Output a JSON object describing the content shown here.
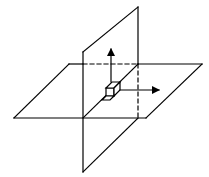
{
  "diagram": {
    "title": "",
    "colors": {
      "stroke": "#000000",
      "background": "#ffffff"
    },
    "horizontal_plane": {
      "points": [
        [
          69,
          64
        ],
        [
          202,
          64
        ],
        [
          146,
          118
        ],
        [
          14,
          118
        ]
      ]
    },
    "vertical_plane": {
      "points": [
        [
          83,
          52
        ],
        [
          138,
          7
        ],
        [
          138,
          118
        ],
        [
          83,
          172
        ]
      ]
    },
    "intersection_line": [
      [
        138,
        64
      ],
      [
        83,
        118
      ]
    ],
    "hidden_edges": [
      [
        [
          83,
          64
        ],
        [
          138,
          64
        ]
      ],
      [
        [
          138,
          64
        ],
        [
          138,
          118
        ]
      ]
    ],
    "arrows": [
      {
        "name": "up-arrow",
        "from": [
          111,
          90
        ],
        "to": [
          111,
          48
        ]
      },
      {
        "name": "right-arrow",
        "from": [
          116,
          90
        ],
        "to": [
          158,
          90
        ]
      }
    ],
    "element_box": {
      "center": [
        111,
        92
      ]
    }
  }
}
